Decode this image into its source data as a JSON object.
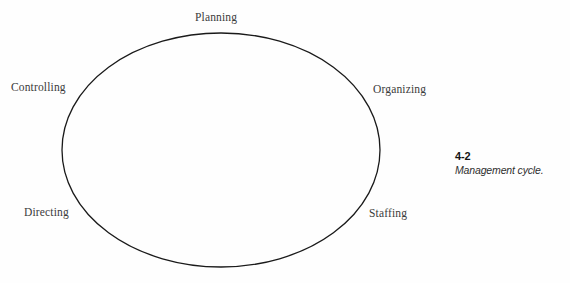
{
  "figure": {
    "background_color": "#fefefe",
    "stroke_color": "#1a1a1a",
    "label_color": "#3b3b3b",
    "caption_number": "4-2",
    "caption_title": "Management cycle."
  },
  "diagram": {
    "shape": "ellipse",
    "ellipse": {
      "cx": 221,
      "cy": 150,
      "rx": 159,
      "ry": 117,
      "stroke_width": 1.3
    },
    "nodes": [
      {
        "id": "planning",
        "label": "Planning",
        "position": "top"
      },
      {
        "id": "organizing",
        "label": "Organizing",
        "position": "upper-right"
      },
      {
        "id": "staffing",
        "label": "Staffing",
        "position": "lower-right"
      },
      {
        "id": "directing",
        "label": "Directing",
        "position": "lower-left"
      },
      {
        "id": "controlling",
        "label": "Controlling",
        "position": "upper-left"
      }
    ]
  },
  "chart_data": {
    "type": "diagram",
    "title": "Management cycle.",
    "subtitle": "4-2",
    "categories": [
      "Planning",
      "Organizing",
      "Staffing",
      "Directing",
      "Controlling"
    ],
    "values": [
      1,
      1,
      1,
      1,
      1
    ],
    "xlabel": "",
    "ylabel": "",
    "grid": false,
    "legend": "none"
  }
}
